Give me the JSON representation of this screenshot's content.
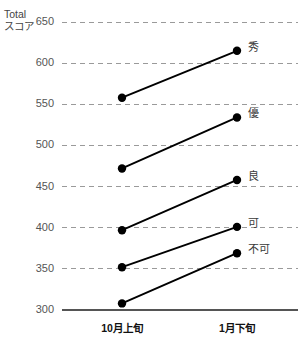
{
  "chart_data": {
    "type": "line",
    "title": "",
    "subtitle": "",
    "xlabel": "",
    "ylabel": "Total\nスコア",
    "ylabel_lines": [
      "Total",
      "スコア"
    ],
    "categories": [
      "10月上旬",
      "1月下旬"
    ],
    "x": [
      0,
      1
    ],
    "xtick_labels": [
      "10月上旬",
      "1月下旬"
    ],
    "ytick_labels": [
      "650",
      "600",
      "550",
      "500",
      "450",
      "400",
      "350",
      "300"
    ],
    "yticks": [
      650,
      600,
      550,
      500,
      450,
      400,
      350,
      300
    ],
    "ylim": [
      300,
      650
    ],
    "grid": true,
    "grid_style": "dashed-horizontal",
    "legend": "none",
    "annotations_position": "right-of-endpoint",
    "series": [
      {
        "name": "秀",
        "label": "秀",
        "values": [
          558,
          615
        ]
      },
      {
        "name": "優",
        "label": "優",
        "values": [
          472,
          534
        ]
      },
      {
        "name": "良",
        "label": "良",
        "values": [
          397,
          458
        ]
      },
      {
        "name": "可",
        "label": "可",
        "values": [
          352,
          401
        ]
      },
      {
        "name": "不可",
        "label": "不可",
        "values": [
          308,
          369
        ]
      }
    ],
    "colors": {
      "line": "#000000",
      "marker": "#000000",
      "grid": "#9a9a9a",
      "axis": "#555555",
      "tick_text": "#555555",
      "label_text": "#3a3a3a",
      "background": "#ffffff"
    }
  },
  "axis": {
    "y_title_line1": "Total",
    "y_title_line2": "スコア"
  },
  "y_ticks": [
    {
      "label": "650",
      "value": 650
    },
    {
      "label": "600",
      "value": 600
    },
    {
      "label": "550",
      "value": 550
    },
    {
      "label": "500",
      "value": 500
    },
    {
      "label": "450",
      "value": 450
    },
    {
      "label": "400",
      "value": 400
    },
    {
      "label": "350",
      "value": 350
    },
    {
      "label": "300",
      "value": 300
    }
  ],
  "x_ticks": [
    {
      "label": "10月上旬"
    },
    {
      "label": "1月下旬"
    }
  ],
  "series_labels": [
    {
      "label": "秀"
    },
    {
      "label": "優"
    },
    {
      "label": "良"
    },
    {
      "label": "可"
    },
    {
      "label": "不可"
    }
  ]
}
